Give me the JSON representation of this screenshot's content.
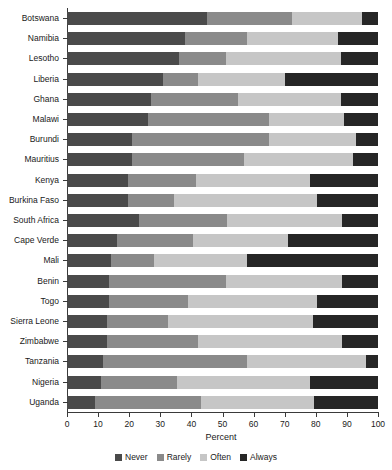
{
  "chart_data": {
    "type": "bar",
    "orientation": "horizontal",
    "stacked": true,
    "stack_mode": "percent",
    "title": "",
    "xlabel": "Percent",
    "ylabel": "",
    "xlim": [
      0,
      100
    ],
    "xticks": [
      0,
      10,
      20,
      30,
      40,
      50,
      60,
      70,
      80,
      90,
      100
    ],
    "grid": false,
    "legend_position": "bottom",
    "categories": [
      "Botswana",
      "Namibia",
      "Lesotho",
      "Liberia",
      "Ghana",
      "Malawi",
      "Burundi",
      "Mauritius",
      "Kenya",
      "Burkina Faso",
      "South Africa",
      "Cape Verde",
      "Mali",
      "Benin",
      "Togo",
      "Sierra Leone",
      "Zimbabwe",
      "Tanzania",
      "Nigeria",
      "Uganda"
    ],
    "series": [
      {
        "name": "Never",
        "color": "#4a4a4a",
        "values": [
          45,
          38,
          36,
          31,
          27,
          26,
          21,
          21,
          19.5,
          19.5,
          23,
          16,
          14,
          13.5,
          13.5,
          13,
          13,
          11.5,
          11,
          9
        ]
      },
      {
        "name": "Rarely",
        "color": "#8a8a8a",
        "values": [
          27.5,
          20,
          15,
          11,
          28,
          39,
          44,
          36,
          22,
          15,
          28.5,
          24.5,
          14,
          37.5,
          25.5,
          19.5,
          29,
          46.5,
          24.5,
          34
        ]
      },
      {
        "name": "Often",
        "color": "#c6c6c6",
        "values": [
          22.5,
          29,
          37,
          28,
          33,
          24,
          28,
          35,
          36.5,
          46,
          37,
          30.5,
          30,
          37.5,
          41.5,
          46.5,
          46.5,
          38,
          42.5,
          36.5
        ]
      },
      {
        "name": "Always",
        "color": "#262626",
        "values": [
          5,
          13,
          12,
          30,
          12,
          11,
          7,
          8,
          22,
          19.5,
          11.5,
          29,
          42,
          11.5,
          19.5,
          21,
          11.5,
          4,
          22,
          20.5
        ]
      }
    ]
  },
  "legend": {
    "items": [
      {
        "label": "Never",
        "color": "#4a4a4a"
      },
      {
        "label": "Rarely",
        "color": "#8a8a8a"
      },
      {
        "label": "Often",
        "color": "#c6c6c6"
      },
      {
        "label": "Always",
        "color": "#262626"
      }
    ]
  },
  "axis": {
    "x_title": "Percent"
  }
}
